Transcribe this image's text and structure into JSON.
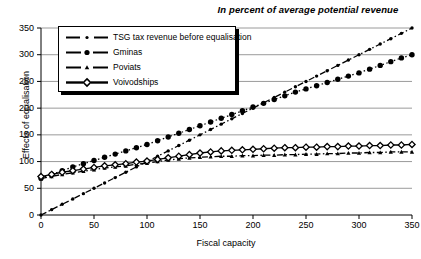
{
  "chart_data": {
    "type": "line",
    "title": "In percent of average potential revenue",
    "xlabel": "Fiscal capacity",
    "ylabel": "Effects of equalisation",
    "xlim": [
      0,
      350
    ],
    "ylim": [
      0,
      350
    ],
    "xticks": [
      0,
      50,
      100,
      150,
      200,
      250,
      300,
      350
    ],
    "yticks": [
      0,
      50,
      100,
      150,
      200,
      250,
      300,
      350
    ],
    "grid": "horizontal",
    "legend_position": "upper-left-inside",
    "x": [
      0,
      10,
      20,
      30,
      40,
      50,
      60,
      70,
      80,
      90,
      100,
      110,
      120,
      130,
      140,
      150,
      160,
      170,
      180,
      190,
      200,
      210,
      220,
      230,
      240,
      250,
      260,
      270,
      280,
      290,
      300,
      310,
      320,
      330,
      340,
      350
    ],
    "series": [
      {
        "name": "TSG tax revenue before equalisation",
        "marker": "small-dot",
        "line": "dash-dot",
        "values": [
          0,
          10,
          20,
          30,
          40,
          50,
          60,
          70,
          80,
          90,
          100,
          110,
          120,
          130,
          140,
          150,
          160,
          170,
          180,
          190,
          200,
          210,
          220,
          230,
          240,
          250,
          260,
          270,
          280,
          290,
          300,
          310,
          320,
          330,
          340,
          350
        ]
      },
      {
        "name": "Gminas",
        "marker": "filled-circle",
        "line": "dotted",
        "values": [
          69,
          76,
          83,
          90,
          96,
          102,
          108,
          114,
          120,
          126,
          132,
          139,
          146,
          153,
          160,
          167,
          174,
          181,
          188,
          195,
          202,
          209,
          216,
          223,
          230,
          236,
          242,
          248,
          254,
          260,
          266,
          273,
          280,
          287,
          294,
          300
        ]
      },
      {
        "name": "Poviats",
        "marker": "small-triangle",
        "line": "dash-dot",
        "values": [
          68,
          72,
          76,
          79,
          82,
          85,
          88,
          90,
          92,
          95,
          97,
          100,
          103,
          105,
          107,
          108,
          109,
          110,
          110,
          111,
          111,
          112,
          112,
          113,
          113,
          114,
          114,
          115,
          115,
          116,
          116,
          117,
          117,
          118,
          118,
          118
        ]
      },
      {
        "name": "Voivodships",
        "marker": "open-diamond",
        "line": "solid",
        "values": [
          72,
          76,
          80,
          83,
          86,
          89,
          92,
          94,
          96,
          99,
          101,
          104,
          107,
          110,
          113,
          116,
          118,
          120,
          121,
          122,
          123,
          124,
          125,
          126,
          126,
          127,
          127,
          128,
          128,
          129,
          129,
          130,
          130,
          131,
          131,
          132
        ]
      }
    ]
  },
  "colors": {
    "line": "#000000",
    "grid": "#808080",
    "background": "#ffffff"
  }
}
